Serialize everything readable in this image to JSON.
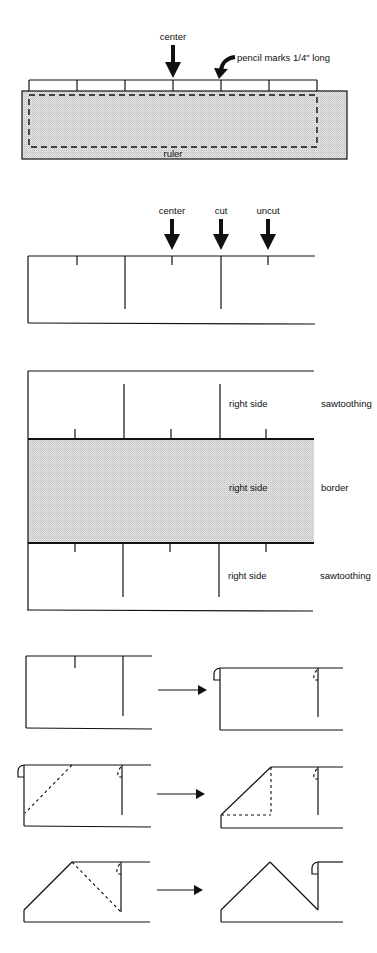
{
  "figure": {
    "colors": {
      "ink": "#111111",
      "shading": "#d6d6d6",
      "background": "#ffffff"
    }
  },
  "step_ruler": {
    "center_label": "center",
    "pencil_label": "pencil marks 1/4\" long",
    "ruler_label": "ruler"
  },
  "step_cut": {
    "labels": [
      "center",
      "cut",
      "uncut"
    ]
  },
  "step_layout": {
    "top_side_label": "right side",
    "top_type_label": "sawtoothing",
    "middle_side_label": "right side",
    "middle_type_label": "border",
    "bottom_side_label": "right side",
    "bottom_type_label": "sawtoothing"
  },
  "fold_steps": [
    {
      "name": "fold-step-1",
      "arrow": "right-arrow"
    },
    {
      "name": "fold-step-2",
      "arrow": "right-arrow"
    },
    {
      "name": "fold-step-3",
      "arrow": "right-arrow"
    }
  ]
}
